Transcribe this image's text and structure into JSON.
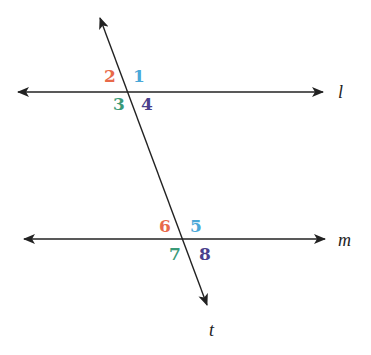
{
  "diagram": {
    "type": "parallel-lines-cut-by-transversal",
    "lines": [
      {
        "id": "l",
        "label": "l",
        "kind": "horizontal",
        "x1": 18,
        "y1": 92,
        "x2": 323,
        "y2": 92,
        "label_x": 338,
        "label_y": 98
      },
      {
        "id": "m",
        "label": "m",
        "kind": "horizontal",
        "x1": 24,
        "y1": 239,
        "x2": 325,
        "y2": 239,
        "label_x": 338,
        "label_y": 246
      },
      {
        "id": "t",
        "label": "t",
        "kind": "transversal",
        "x1": 100,
        "y1": 18,
        "x2": 207,
        "y2": 305,
        "label_x": 209,
        "label_y": 336
      }
    ],
    "angles": [
      {
        "number": "1",
        "x": 133,
        "y": 82,
        "color": "#4aa8d8"
      },
      {
        "number": "2",
        "x": 104,
        "y": 82,
        "color": "#e8694a"
      },
      {
        "number": "3",
        "x": 113,
        "y": 110,
        "color": "#3a9a78"
      },
      {
        "number": "4",
        "x": 141,
        "y": 110,
        "color": "#4a3f8c"
      },
      {
        "number": "5",
        "x": 190,
        "y": 232,
        "color": "#4aa8d8"
      },
      {
        "number": "6",
        "x": 159,
        "y": 232,
        "color": "#e8694a"
      },
      {
        "number": "7",
        "x": 169,
        "y": 260,
        "color": "#3a9a78"
      },
      {
        "number": "8",
        "x": 199,
        "y": 260,
        "color": "#4a3f8c"
      }
    ],
    "line_color": "#222222"
  }
}
